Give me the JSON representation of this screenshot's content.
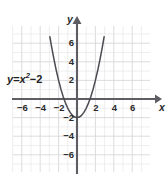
{
  "figure": {
    "equation_label": "y = x² − 2",
    "equation_parts": {
      "lhs": "y",
      "eq": "=",
      "base": "x",
      "exponent": "2",
      "minus": "−",
      "constant": "2"
    },
    "x_axis_name": "x",
    "y_axis_name": "y"
  },
  "colors": {
    "grid": "#d8d8da",
    "grid_minor": "#e8e8ea",
    "axis": "#5d5d63",
    "curve": "#4a4a50",
    "text": "#2b2b2b",
    "background": "#ffffff"
  },
  "chart_data": {
    "type": "line",
    "title": "",
    "subtitle": "",
    "xlabel": "x",
    "ylabel": "y",
    "annotations": [
      "y = x² − 2"
    ],
    "grid": true,
    "legend": "none",
    "xlim": [
      -7,
      7
    ],
    "ylim": [
      -7.5,
      8
    ],
    "xticks": [
      -6,
      -4,
      -2,
      2,
      4,
      6
    ],
    "yticks": [
      6,
      4,
      2,
      -2,
      -4,
      -6
    ],
    "xtick_labels": [
      "−6",
      "−4",
      "−2",
      "2",
      "4",
      "6"
    ],
    "ytick_labels": [
      "6",
      "4",
      "2",
      "−2",
      "−4",
      "−6"
    ],
    "series": [
      {
        "name": "y = x² − 2",
        "function": "y = x^2 - 2",
        "vertex": [
          0,
          -2
        ],
        "roots": [
          -1.414,
          1.414
        ],
        "x": [
          -2.95,
          -2.75,
          -2.5,
          -2.25,
          -2,
          -1.75,
          -1.5,
          -1.25,
          -1,
          -0.75,
          -0.5,
          -0.25,
          0,
          0.25,
          0.5,
          0.75,
          1,
          1.25,
          1.5,
          1.75,
          2,
          2.25,
          2.5,
          2.75,
          2.95
        ],
        "values": [
          6.7,
          5.56,
          4.25,
          3.06,
          2,
          1.06,
          0.25,
          -0.44,
          -1,
          -1.44,
          -1.75,
          -1.94,
          -2,
          -1.94,
          -1.75,
          -1.44,
          -1,
          -0.44,
          0.25,
          1.06,
          2,
          3.06,
          4.25,
          5.56,
          6.7
        ]
      }
    ]
  },
  "geometry": {
    "origin_px": [
      77,
      99
    ],
    "unit_px_x": 9.2,
    "unit_px_y": 9.3,
    "grid_rect_px": [
      13,
      26,
      137,
      146
    ]
  }
}
